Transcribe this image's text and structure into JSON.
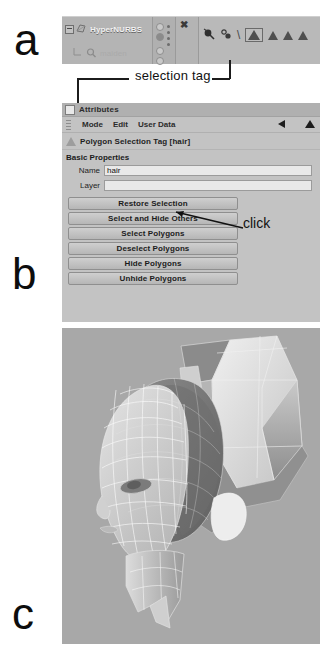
{
  "figure": {
    "label_a": "a",
    "label_b": "b",
    "label_c": "c"
  },
  "callouts": {
    "selection_tag": "selection tag",
    "click": "click"
  },
  "object_manager": {
    "rows": [
      {
        "name": "HyperNURBS",
        "icon": "hypernurbs-icon",
        "indent": 0,
        "expander": "collapse-toggle"
      },
      {
        "name": "maiden",
        "icon": "polygon-object-icon",
        "indent": 1,
        "expander": "tree-branch"
      }
    ],
    "tags": [
      {
        "icon": "texture-tag-icon",
        "selected": false
      },
      {
        "icon": "material-tag-icon",
        "selected": false
      },
      {
        "icon": "backslash-icon",
        "selected": false
      },
      {
        "icon": "polygon-selection-tag-icon",
        "selected": true
      },
      {
        "icon": "polygon-selection-tag-icon",
        "selected": false
      },
      {
        "icon": "polygon-selection-tag-icon",
        "selected": false
      },
      {
        "icon": "polygon-selection-tag-icon",
        "selected": false
      }
    ],
    "close_icon": "close-x-icon"
  },
  "attributes": {
    "title": "Attributes",
    "menu": [
      "Mode",
      "Edit",
      "User Data"
    ],
    "nav_back_icon": "arrow-left-icon",
    "nav_up_icon": "arrow-up-icon",
    "object_header": "Polygon Selection Tag [hair]",
    "section_title": "Basic Properties",
    "fields": [
      {
        "label": "Name",
        "value": "hair",
        "placeholder": ""
      },
      {
        "label": "Layer",
        "value": "",
        "placeholder": ""
      }
    ],
    "buttons": [
      "Restore Selection",
      "Select and Hide Others",
      "Select Polygons",
      "Deselect Polygons",
      "Hide Polygons",
      "Unhide Polygons"
    ]
  },
  "viewport": {
    "scene_description": "3D head model with hair polygon selection highlighted",
    "background_color": "#a8a8a8"
  }
}
